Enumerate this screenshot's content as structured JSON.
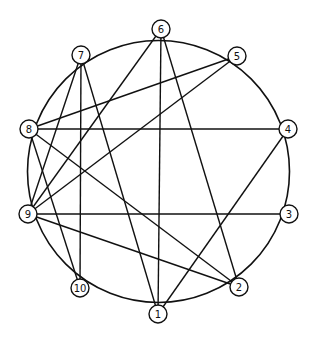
{
  "diagram": {
    "type": "graph",
    "layout": "circular",
    "colors": {
      "stroke": "#111111",
      "background": "#ffffff"
    },
    "nodes": [
      {
        "id": "1",
        "label": "1",
        "x": 158,
        "y": 314
      },
      {
        "id": "2",
        "label": "2",
        "x": 239,
        "y": 287
      },
      {
        "id": "3",
        "label": "3",
        "x": 289,
        "y": 214
      },
      {
        "id": "4",
        "label": "4",
        "x": 288,
        "y": 129
      },
      {
        "id": "5",
        "label": "5",
        "x": 237,
        "y": 56
      },
      {
        "id": "6",
        "label": "6",
        "x": 161,
        "y": 29
      },
      {
        "id": "7",
        "label": "7",
        "x": 81,
        "y": 55
      },
      {
        "id": "8",
        "label": "8",
        "x": 29,
        "y": 129
      },
      {
        "id": "9",
        "label": "9",
        "x": 28,
        "y": 214
      },
      {
        "id": "10",
        "label": "10",
        "x": 80,
        "y": 288
      }
    ],
    "ring_edges": [
      [
        "1",
        "2"
      ],
      [
        "2",
        "3"
      ],
      [
        "3",
        "4"
      ],
      [
        "4",
        "5"
      ],
      [
        "5",
        "6"
      ],
      [
        "6",
        "7"
      ],
      [
        "7",
        "8"
      ],
      [
        "8",
        "9"
      ],
      [
        "9",
        "10"
      ],
      [
        "10",
        "1"
      ]
    ],
    "chord_edges": [
      [
        "7",
        "10"
      ],
      [
        "7",
        "1"
      ],
      [
        "7",
        "9"
      ],
      [
        "6",
        "1"
      ],
      [
        "6",
        "2"
      ],
      [
        "6",
        "9"
      ],
      [
        "5",
        "8"
      ],
      [
        "5",
        "9"
      ],
      [
        "4",
        "8"
      ],
      [
        "4",
        "1"
      ],
      [
        "8",
        "10"
      ],
      [
        "8",
        "2"
      ],
      [
        "9",
        "3"
      ],
      [
        "9",
        "2"
      ]
    ]
  }
}
